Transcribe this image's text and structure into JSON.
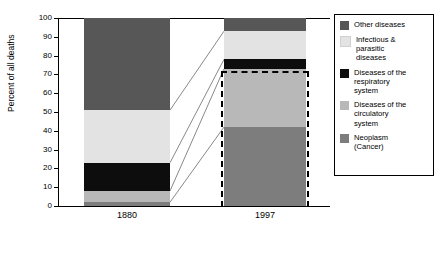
{
  "chart_data": {
    "type": "bar",
    "subtype": "stacked-100-percent",
    "title": "",
    "xlabel": "",
    "ylabel": "Percent of all deaths",
    "ylim": [
      0,
      100
    ],
    "yticks": [
      0,
      10,
      20,
      30,
      40,
      50,
      60,
      70,
      80,
      90,
      100
    ],
    "ytick_labels": [
      "0",
      "10",
      "20",
      "30",
      "40",
      "50",
      "60",
      "70",
      "80",
      "90",
      "100"
    ],
    "categories": [
      "1880",
      "1997"
    ],
    "grid": false,
    "legend_position": "right",
    "series": [
      {
        "name": "Other diseases",
        "legend_label": "Other diseases",
        "color": "#575757",
        "values": [
          49,
          7
        ]
      },
      {
        "name": "Infectious & parasitic diseases",
        "legend_label": "Infectious &\nparasitic\ndiseases",
        "color": "#e3e3e3",
        "values": [
          28,
          15
        ]
      },
      {
        "name": "Diseases of the respiratory system",
        "legend_label": "Diseases of the\nrespiratory\nsystem",
        "color": "#0d0d0d",
        "values": [
          15,
          5
        ]
      },
      {
        "name": "Diseases of the circulatory system",
        "legend_label": "Diseases of the\ncirculatory\nsystem",
        "color": "#b8b8b8",
        "values": [
          6,
          31
        ]
      },
      {
        "name": "Neoplasm (Cancer)",
        "legend_label": "Neoplasm\n(Cancer)",
        "color": "#7d7d7d",
        "values": [
          2,
          42
        ]
      }
    ],
    "annotations": {
      "highlighted_bar": "1997",
      "highlight_style": "dashed black outline",
      "connector_lines": "gray lines linking 1880 segment boundaries to corresponding 1997 segment boundaries"
    },
    "colors": {
      "axis": "#000000",
      "connector": "#7a7a7a",
      "background": "#ffffff",
      "legend_border": "#000000"
    }
  },
  "axes": {
    "y_title": "Percent of all deaths",
    "y_tick_labels": [
      "100",
      "90",
      "80",
      "70",
      "60",
      "50",
      "40",
      "30",
      "20",
      "10",
      "0"
    ],
    "x_tick_labels": [
      "1880",
      "1997"
    ]
  },
  "legend": {
    "items": [
      {
        "label": "Other diseases",
        "color": "#575757"
      },
      {
        "label": "Infectious &\nparasitic\ndiseases",
        "color": "#e3e3e3"
      },
      {
        "label": "Diseases of the\nrespiratory\nsystem",
        "color": "#0d0d0d"
      },
      {
        "label": "Diseases of the\ncirculatory\nsystem",
        "color": "#b8b8b8"
      },
      {
        "label": "Neoplasm\n(Cancer)",
        "color": "#7d7d7d"
      }
    ]
  }
}
